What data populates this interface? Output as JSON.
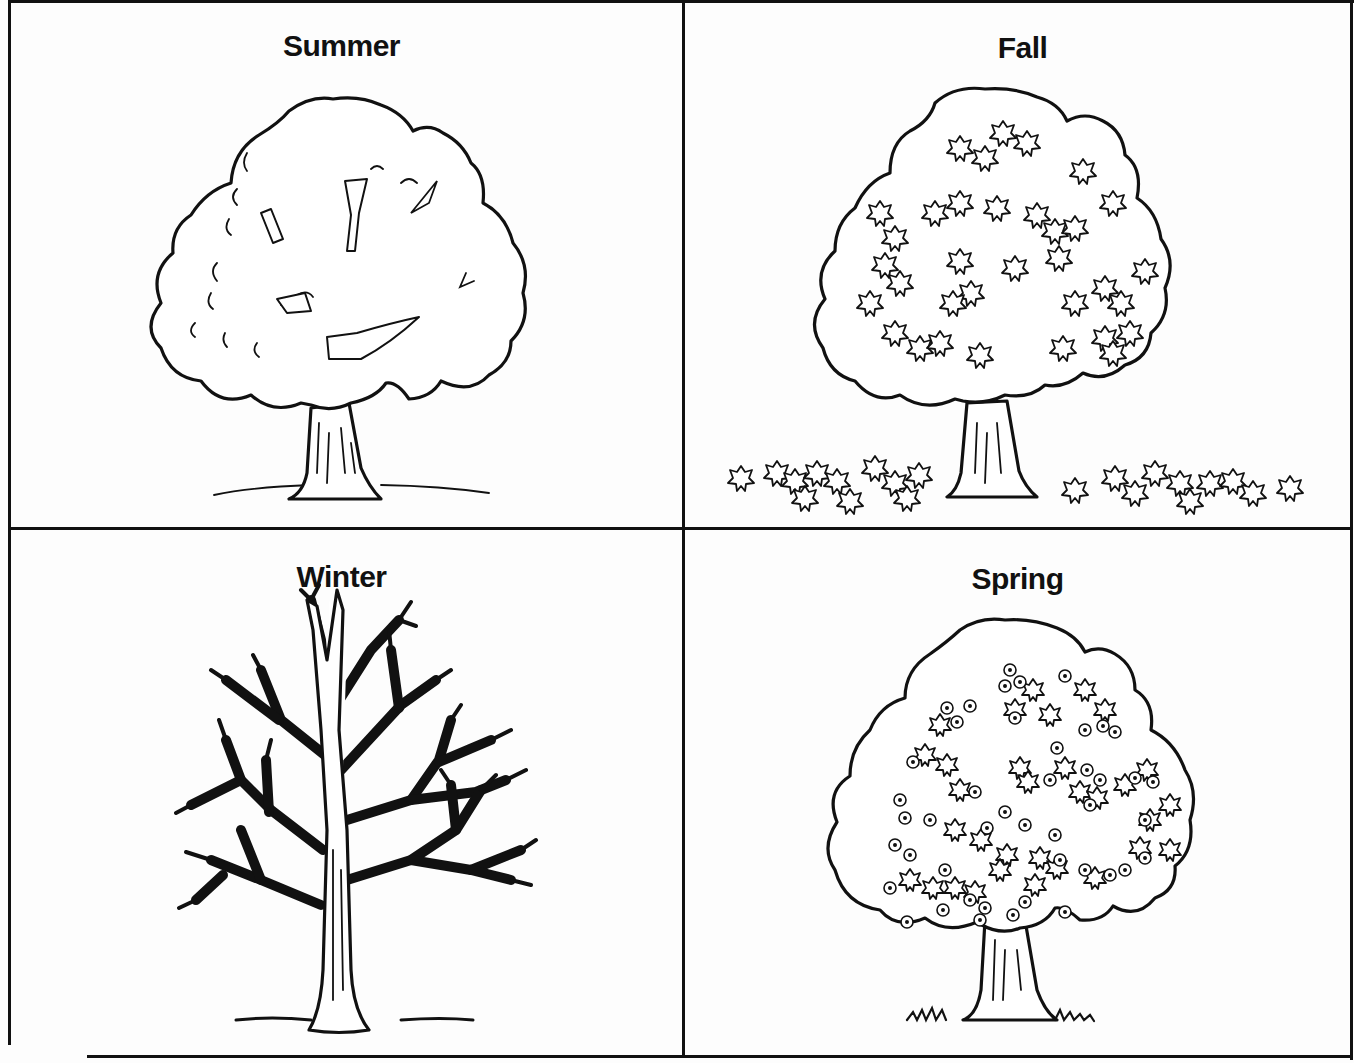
{
  "worksheet": {
    "layout": "2x2 grid",
    "panels": [
      {
        "position": "top-left",
        "label": "Summer",
        "illustration": "tree-full-foliage-icon"
      },
      {
        "position": "top-right",
        "label": "Fall",
        "illustration": "tree-with-falling-leaves-icon"
      },
      {
        "position": "bottom-left",
        "label": "Winter",
        "illustration": "bare-tree-icon"
      },
      {
        "position": "bottom-right",
        "label": "Spring",
        "illustration": "blossoming-tree-icon"
      }
    ],
    "colors": {
      "ink": "#111111",
      "paper": "#fdfdfd"
    }
  }
}
